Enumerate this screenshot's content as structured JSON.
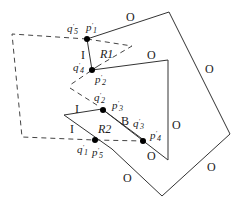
{
  "diagram": {
    "outer_polygon_edge_label": "O",
    "regions": {
      "r1": "R1",
      "r2": "R2"
    },
    "edge_labels": {
      "i_left_r1": "I",
      "i_upper_r2": "I",
      "i_lower_r2": "I",
      "b_r2": "B",
      "o_outer_top": "O",
      "o_outer_right": "O",
      "o_outer_right_lower": "O",
      "o_outer_bottom_left": "O",
      "o_inner_top": "O",
      "o_inner_right": "O",
      "o_inner_bottom": "O"
    },
    "points": {
      "q5": {
        "base": "q",
        "sup": "'",
        "sub": "5"
      },
      "p1": {
        "base": "p",
        "sup": "'",
        "sub": "1"
      },
      "q4": {
        "base": "q",
        "sup": "'",
        "sub": "4"
      },
      "p2": {
        "base": "p",
        "sup": "'",
        "sub": "2"
      },
      "q2": {
        "base": "q",
        "sup": "'",
        "sub": "2"
      },
      "p3": {
        "base": "p",
        "sup": "'",
        "sub": "3"
      },
      "q3": {
        "base": "q",
        "sup": "'",
        "sub": "3"
      },
      "p4": {
        "base": "p",
        "sup": "'",
        "sub": "4"
      },
      "q1": {
        "base": "q",
        "sup": "'",
        "sub": "1"
      },
      "p5": {
        "base": "p",
        "sup": "'",
        "sub": "5"
      }
    }
  }
}
